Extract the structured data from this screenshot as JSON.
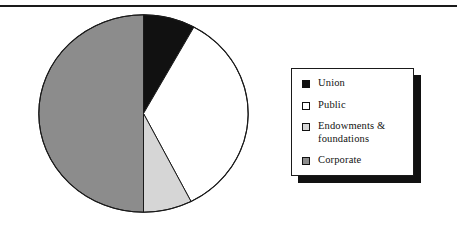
{
  "figure": {
    "clipped_caption": "",
    "rule_color": "#1a1a1a"
  },
  "chart_data": {
    "type": "pie",
    "title": "",
    "subtitle": "",
    "xlabel": "",
    "ylabel": "",
    "grid": false,
    "legend_position": "right",
    "start_angle_deg": 0,
    "direction": "clockwise",
    "categories": [
      "Union",
      "Public",
      "Endowments & foundations",
      "Corporate"
    ],
    "values": [
      8,
      34.5,
      7.5,
      50
    ],
    "units": "percent",
    "slice_colors": [
      "#111111",
      "#ffffff",
      "#d6d6d6",
      "#8c8c8c"
    ],
    "slice_edge_color": "#1a1a1a",
    "slices": [
      {
        "label": "Union",
        "value": 8,
        "color": "#111111",
        "start_deg": 0,
        "end_deg": 28.8
      },
      {
        "label": "Public",
        "value": 34.5,
        "color": "#ffffff",
        "start_deg": 28.8,
        "end_deg": 153
      },
      {
        "label": "Endowments & foundations",
        "value": 7.5,
        "color": "#d6d6d6",
        "start_deg": 153,
        "end_deg": 180
      },
      {
        "label": "Corporate",
        "value": 50,
        "color": "#8c8c8c",
        "start_deg": 180,
        "end_deg": 360
      }
    ]
  },
  "legend": {
    "items": [
      {
        "label": "Union",
        "swatch_color": "#111111"
      },
      {
        "label": "Public",
        "swatch_color": "#ffffff"
      },
      {
        "label": "Endowments & foundations",
        "swatch_color": "#d6d6d6"
      },
      {
        "label": "Corporate",
        "swatch_color": "#8c8c8c"
      }
    ]
  }
}
